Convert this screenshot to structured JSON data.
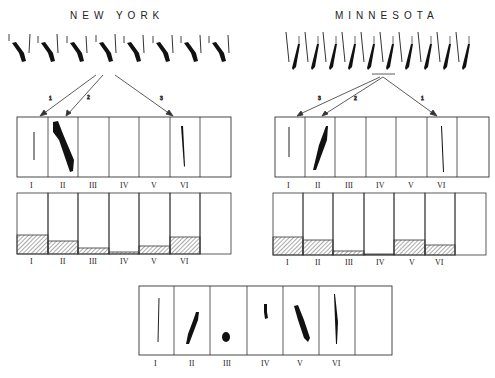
{
  "panels": {
    "new_york": {
      "title": "NEW   YORK",
      "arrow_labels": [
        "1",
        "2",
        "3"
      ],
      "strip_labels": [
        "I",
        "II",
        "III",
        "IV",
        "V",
        "VI"
      ],
      "hist_labels": [
        "I",
        "II",
        "III",
        "IV",
        "V",
        "VI"
      ],
      "hist_fill": [
        0.25,
        0.15,
        0.06,
        0.03,
        0.11,
        0.22
      ]
    },
    "minnesota": {
      "title": "MINNESOTA",
      "arrow_labels": [
        "3",
        "2",
        "1"
      ],
      "strip_labels": [
        "I",
        "II",
        "III",
        "IV",
        "V",
        "VI"
      ],
      "hist_labels": [
        "I",
        "II",
        "III",
        "IV",
        "V",
        "VI"
      ],
      "hist_fill": [
        0.22,
        0.18,
        0.05,
        0.02,
        0.18,
        0.12
      ]
    },
    "bottom": {
      "strip_labels": [
        "I",
        "II",
        "III",
        "IV",
        "V",
        "VI"
      ]
    }
  },
  "colors": {
    "ink": "#1a1a1a",
    "hatch": "#555555",
    "background": "#ffffff"
  }
}
